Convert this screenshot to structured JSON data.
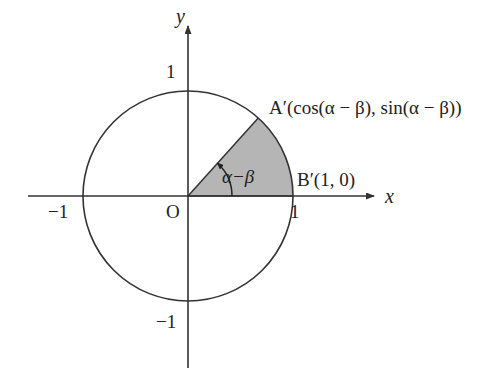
{
  "figure": {
    "kind": "unit-circle-diagram",
    "background_color": "#ffffff",
    "stroke_color": "#333333",
    "sector_fill_color": "#b5b5b5",
    "sector_fill_label": "gray",
    "width": 485,
    "height": 385
  },
  "axes": {
    "x_label": "x",
    "y_label": "y",
    "origin_label": "O",
    "x_ticks": [
      {
        "value": -1,
        "label": "−1"
      },
      {
        "value": 1,
        "label": "1"
      }
    ],
    "y_ticks": [
      {
        "value": 1,
        "label": "1"
      },
      {
        "value": -1,
        "label": "−1"
      }
    ]
  },
  "circle": {
    "center_x": 188,
    "center_y": 196,
    "radius_px": 105,
    "radius_value": 1
  },
  "sector": {
    "start_angle_deg": 0,
    "end_angle_deg": 48,
    "angle_label": "α−β",
    "angle_label_plain": "alpha minus beta",
    "arc_radius_px": 44
  },
  "points": [
    {
      "name": "A-prime",
      "label": "A′(cos(α − β), sin(α − β))",
      "label_parts": {
        "point": "A",
        "prime": "′",
        "x_coord": "cos(α − β)",
        "y_coord": "sin(α − β)"
      },
      "angle_deg": 48
    },
    {
      "name": "B-prime",
      "label": "B′(1, 0)",
      "label_parts": {
        "point": "B",
        "prime": "′",
        "x_coord": "1",
        "y_coord": "0"
      },
      "angle_deg": 0
    }
  ]
}
